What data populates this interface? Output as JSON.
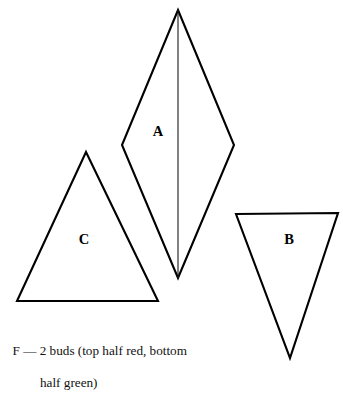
{
  "figure": {
    "background_color": "#ffffff",
    "stroke_color": "#000000",
    "shapes": [
      {
        "id": "shape-a",
        "label": "A",
        "type": "rhombus",
        "description": "tall vertical rhombus divided by a vertical center line",
        "label_x": 158,
        "label_y": 133,
        "points": "178,10 234,145 178,278 122,145",
        "divider": "178,10 178,278"
      },
      {
        "id": "shape-c",
        "label": "C",
        "type": "triangle-up",
        "description": "upward pointing triangle",
        "label_x": 84,
        "label_y": 241,
        "points": "86,152 158,301 17,301"
      },
      {
        "id": "shape-b",
        "label": "B",
        "type": "triangle-down",
        "description": "downward pointing inverted triangle",
        "label_x": 289,
        "label_y": 241,
        "points": "236,214 338,213 290,358"
      }
    ]
  },
  "caption": {
    "line1": "F — 2 buds (top half red, bottom",
    "line2": "half green)",
    "key": "F",
    "dash": "—",
    "text": "2 buds (top half red, bottom half green)"
  }
}
